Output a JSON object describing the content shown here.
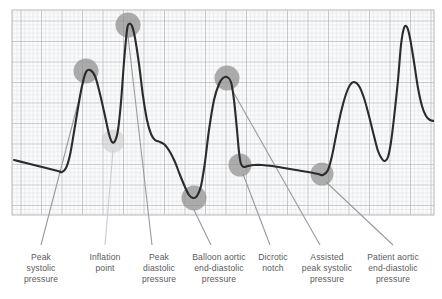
{
  "figure": {
    "background": "#ffffff",
    "grid": {
      "x": 12,
      "y": 10,
      "width": 422,
      "height": 205,
      "minor_step": 4.1,
      "major_every": 5,
      "minor_color": "#cfd2d6",
      "major_color": "#a9adb3",
      "fill": "#fbfbfc",
      "border_color": "#b4b8bd"
    },
    "waveform": {
      "stroke": "#2b2b2b",
      "stroke_width": 2.1,
      "points": [
        [
          14,
          160
        ],
        [
          26,
          163
        ],
        [
          38,
          166
        ],
        [
          50,
          169
        ],
        [
          58,
          171
        ],
        [
          62,
          172
        ],
        [
          66,
          168
        ],
        [
          70,
          155
        ],
        [
          74,
          132
        ],
        [
          78,
          108
        ],
        [
          82,
          86
        ],
        [
          86,
          72
        ],
        [
          90,
          70
        ],
        [
          95,
          76
        ],
        [
          100,
          94
        ],
        [
          105,
          116
        ],
        [
          109,
          134
        ],
        [
          112,
          142
        ],
        [
          115,
          141
        ],
        [
          118,
          130
        ],
        [
          121,
          102
        ],
        [
          124,
          62
        ],
        [
          127,
          30
        ],
        [
          129,
          24
        ],
        [
          132,
          26
        ],
        [
          135,
          38
        ],
        [
          139,
          64
        ],
        [
          143,
          96
        ],
        [
          147,
          120
        ],
        [
          151,
          134
        ],
        [
          155,
          140
        ],
        [
          160,
          142
        ],
        [
          165,
          145
        ],
        [
          170,
          152
        ],
        [
          175,
          162
        ],
        [
          180,
          175
        ],
        [
          185,
          187
        ],
        [
          189,
          195
        ],
        [
          193,
          198
        ],
        [
          197,
          196
        ],
        [
          201,
          186
        ],
        [
          205,
          162
        ],
        [
          209,
          130
        ],
        [
          214,
          100
        ],
        [
          219,
          84
        ],
        [
          223,
          78
        ],
        [
          227,
          77
        ],
        [
          231,
          82
        ],
        [
          234,
          100
        ],
        [
          237,
          130
        ],
        [
          239,
          152
        ],
        [
          241,
          164
        ],
        [
          244,
          167
        ],
        [
          248,
          166
        ],
        [
          254,
          165
        ],
        [
          262,
          165
        ],
        [
          272,
          166
        ],
        [
          284,
          168
        ],
        [
          296,
          170
        ],
        [
          308,
          172
        ],
        [
          318,
          174
        ],
        [
          323,
          175
        ],
        [
          328,
          170
        ],
        [
          332,
          156
        ],
        [
          336,
          136
        ],
        [
          341,
          112
        ],
        [
          346,
          94
        ],
        [
          350,
          85
        ],
        [
          354,
          82
        ],
        [
          359,
          86
        ],
        [
          364,
          98
        ],
        [
          369,
          116
        ],
        [
          374,
          136
        ],
        [
          378,
          151
        ],
        [
          382,
          159
        ],
        [
          385,
          161
        ],
        [
          388,
          157
        ],
        [
          391,
          142
        ],
        [
          394,
          118
        ],
        [
          398,
          80
        ],
        [
          401,
          45
        ],
        [
          404,
          28
        ],
        [
          407,
          27
        ],
        [
          410,
          38
        ],
        [
          414,
          62
        ],
        [
          418,
          88
        ],
        [
          422,
          106
        ],
        [
          426,
          116
        ],
        [
          430,
          120
        ],
        [
          434,
          121
        ]
      ]
    },
    "markers": [
      {
        "name": "peak-systolic-pressure",
        "x": 86,
        "y": 71,
        "r": 12.5,
        "color": "#8d8d8d",
        "opacity": 0.72
      },
      {
        "name": "inflation-point",
        "x": 113,
        "y": 141,
        "r": 11.5,
        "color": "#c8c8c8",
        "opacity": 0.55
      },
      {
        "name": "peak-diastolic-pressure",
        "x": 128,
        "y": 25,
        "r": 12.5,
        "color": "#8d8d8d",
        "opacity": 0.72
      },
      {
        "name": "balloon-aortic-end-diastolic-pressure",
        "x": 194,
        "y": 198,
        "r": 12.5,
        "color": "#8d8d8d",
        "opacity": 0.72
      },
      {
        "name": "assisted-peak-systolic-pressure",
        "x": 227,
        "y": 78,
        "r": 12.5,
        "color": "#8d8d8d",
        "opacity": 0.72
      },
      {
        "name": "dicrotic-notch",
        "x": 240,
        "y": 165,
        "r": 11.5,
        "color": "#8d8d8d",
        "opacity": 0.7
      },
      {
        "name": "patient-aortic-end-diastolic-pressure",
        "x": 322,
        "y": 174,
        "r": 11.5,
        "color": "#8d8d8d",
        "opacity": 0.7
      }
    ],
    "leaders": [
      {
        "name": "leader-peak-systolic",
        "x1": 84,
        "y1": 80,
        "x2": 41,
        "y2": 245,
        "color": "#9a9a9a",
        "width": 1.1
      },
      {
        "name": "leader-inflation-point",
        "x1": 113,
        "y1": 150,
        "x2": 105,
        "y2": 245,
        "color": "#cccccc",
        "width": 1.1
      },
      {
        "name": "leader-peak-diastolic",
        "x1": 128,
        "y1": 36,
        "x2": 152,
        "y2": 245,
        "color": "#9a9a9a",
        "width": 1.1
      },
      {
        "name": "leader-balloon-end-diastolic",
        "x1": 194,
        "y1": 210,
        "x2": 211,
        "y2": 245,
        "color": "#9a9a9a",
        "width": 1.1
      },
      {
        "name": "leader-dicrotic-notch",
        "x1": 243,
        "y1": 174,
        "x2": 270,
        "y2": 245,
        "color": "#9a9a9a",
        "width": 1.1
      },
      {
        "name": "leader-assisted-peak-systolic",
        "x1": 231,
        "y1": 88,
        "x2": 320,
        "y2": 245,
        "color": "#9a9a9a",
        "width": 1.1
      },
      {
        "name": "leader-patient-aortic-end-diastolic",
        "x1": 326,
        "y1": 182,
        "x2": 393,
        "y2": 245,
        "color": "#9a9a9a",
        "width": 1.1
      }
    ],
    "captions": [
      {
        "name": "caption-peak-systolic-pressure",
        "center_x": 41,
        "top": 252,
        "lines": [
          "Peak",
          "systolic",
          "pressure"
        ]
      },
      {
        "name": "caption-inflation-point",
        "center_x": 105,
        "top": 252,
        "lines": [
          "Inflation",
          "point"
        ]
      },
      {
        "name": "caption-peak-diastolic-pressure",
        "center_x": 159,
        "top": 252,
        "lines": [
          "Peak",
          "diastolic",
          "pressure"
        ]
      },
      {
        "name": "caption-balloon-aortic-end-diastolic-pressure",
        "center_x": 219,
        "top": 252,
        "lines": [
          "Balloon aortic",
          "end-diastolic",
          "pressure"
        ]
      },
      {
        "name": "caption-dicrotic-notch",
        "center_x": 273,
        "top": 252,
        "lines": [
          "Dicrotic",
          "notch"
        ]
      },
      {
        "name": "caption-assisted-peak-systolic-pressure",
        "center_x": 327,
        "top": 252,
        "lines": [
          "Assisted",
          "peak systolic",
          "pressure"
        ]
      },
      {
        "name": "caption-patient-aortic-end-diastolic-pressure",
        "center_x": 393,
        "top": 252,
        "lines": [
          "Patient aortic",
          "end-diastolic",
          "pressure"
        ]
      }
    ]
  }
}
